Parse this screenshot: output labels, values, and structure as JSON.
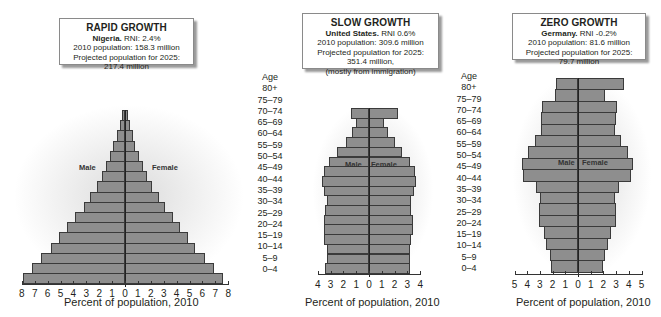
{
  "panels": [
    {
      "title": "RAPID GROWTH",
      "country": "Nigeria.",
      "rni": " RNI: 2.4%",
      "pop2010": "2010 population: 158.3 million",
      "proj2025": "Projected population for 2025: 217.4 million",
      "note": "",
      "male_label": "Male",
      "female_label": "Female",
      "xlabel": "Percent of population, 2010",
      "ticks": [
        "8",
        "7",
        "6",
        "5",
        "4",
        "3",
        "2",
        "1",
        "0",
        "1",
        "2",
        "3",
        "4",
        "5",
        "6",
        "7",
        "8"
      ]
    },
    {
      "title": "SLOW GROWTH",
      "country": "United States.",
      "rni": " RNI 0.6%",
      "pop2010": "2010 population: 309.6 million",
      "proj2025": "Projected population for 2025: 351.4 million,",
      "note": "(mostly from immigration)",
      "male_label": "Male",
      "female_label": "Female",
      "xlabel": "Percent of population, 2010",
      "ticks": [
        "4",
        "3",
        "2",
        "1",
        "0",
        "1",
        "2",
        "3",
        "4"
      ]
    },
    {
      "title": "ZERO GROWTH",
      "country": "Germany.",
      "rni": " RNI -0.2%",
      "pop2010": "2010 population: 81.6 million",
      "proj2025": "Projected population for 2025: 79.7 million",
      "note": "",
      "male_label": "Male",
      "female_label": "Female",
      "xlabel": "Percent of population, 2010",
      "ticks": [
        "5",
        "4",
        "3",
        "2",
        "1",
        "0",
        "1",
        "2",
        "3",
        "4",
        "5"
      ]
    }
  ],
  "age_header": "Age",
  "age_groups": [
    "80+",
    "75–79",
    "70–74",
    "65–69",
    "60–64",
    "55–59",
    "50–54",
    "45–49",
    "40–44",
    "35–39",
    "30–34",
    "25–29",
    "20–24",
    "15–19",
    "10–14",
    "5–9",
    "0–4"
  ],
  "chart_data": [
    {
      "type": "bar",
      "title": "RAPID GROWTH — Nigeria. RNI: 2.4%",
      "xlabel": "Percent of population, 2010",
      "ylabel": "Age",
      "categories": [
        "80+",
        "75–79",
        "70–74",
        "65–69",
        "60–64",
        "55–59",
        "50–54",
        "45–49",
        "40–44",
        "35–39",
        "30–34",
        "25–29",
        "20–24",
        "15–19",
        "10–14",
        "5–9",
        "0–4"
      ],
      "series": [
        {
          "name": "Male",
          "values": [
            0.2,
            0.4,
            0.6,
            0.9,
            1.2,
            1.5,
            1.8,
            2.2,
            2.7,
            3.2,
            3.9,
            4.5,
            5.1,
            5.7,
            6.5,
            7.2,
            7.9
          ]
        },
        {
          "name": "Female",
          "values": [
            0.2,
            0.4,
            0.6,
            0.8,
            1.1,
            1.4,
            1.7,
            2.1,
            2.6,
            3.1,
            3.7,
            4.3,
            4.9,
            5.4,
            6.2,
            6.9,
            7.6
          ]
        }
      ],
      "xlim": [
        -8,
        8
      ],
      "grid": false,
      "legend_position": "inline labels"
    },
    {
      "type": "bar",
      "title": "SLOW GROWTH — United States. RNI 0.6%",
      "xlabel": "Percent of population, 2010",
      "ylabel": "Age",
      "categories": [
        "80+",
        "75–79",
        "70–74",
        "65–69",
        "60–64",
        "55–59",
        "50–54",
        "45–49",
        "40–44",
        "35–39",
        "30–34",
        "25–29",
        "20–24",
        "15–19",
        "10–14",
        "5–9",
        "0–4"
      ],
      "series": [
        {
          "name": "Male",
          "values": [
            1.4,
            1.0,
            1.3,
            1.8,
            2.5,
            3.1,
            3.5,
            3.7,
            3.5,
            3.3,
            3.4,
            3.5,
            3.5,
            3.5,
            3.3,
            3.3,
            3.4
          ]
        },
        {
          "name": "Female",
          "values": [
            2.3,
            1.2,
            1.5,
            2.0,
            2.6,
            3.2,
            3.6,
            3.7,
            3.5,
            3.3,
            3.3,
            3.4,
            3.4,
            3.3,
            3.2,
            3.2,
            3.2
          ]
        }
      ],
      "xlim": [
        -4,
        4
      ],
      "grid": false,
      "legend_position": "inline labels"
    },
    {
      "type": "bar",
      "title": "ZERO GROWTH — Germany. RNI -0.2%",
      "xlabel": "Percent of population, 2010",
      "ylabel": "Age",
      "categories": [
        "80+",
        "75–79",
        "70–74",
        "65–69",
        "60–64",
        "55–59",
        "50–54",
        "45–49",
        "40–44",
        "35–39",
        "30–34",
        "25–29",
        "20–24",
        "15–19",
        "10–14",
        "5–9",
        "0–4"
      ],
      "series": [
        {
          "name": "Male",
          "values": [
            1.7,
            1.8,
            2.8,
            2.9,
            2.9,
            3.4,
            3.9,
            4.4,
            4.3,
            3.3,
            3.0,
            3.1,
            3.1,
            2.7,
            2.5,
            2.2,
            2.1
          ]
        },
        {
          "name": "Female",
          "values": [
            3.6,
            2.1,
            3.1,
            3.0,
            2.9,
            3.4,
            3.9,
            4.3,
            4.2,
            3.2,
            2.9,
            3.0,
            3.0,
            2.6,
            2.4,
            2.1,
            2.0
          ]
        }
      ],
      "xlim": [
        -5,
        5
      ],
      "grid": false,
      "legend_position": "inline labels"
    }
  ]
}
